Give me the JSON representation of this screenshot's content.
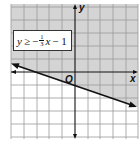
{
  "figure": {
    "type": "linear-inequality-graph",
    "inequality": {
      "lhs": "y",
      "relation": "≥",
      "sign": "−",
      "slope_numerator": "1",
      "slope_denominator": "3",
      "variable": "x",
      "constant_term": "− 1"
    },
    "axes": {
      "x_label": "x",
      "y_label": "y",
      "origin_label": "O"
    },
    "line": {
      "slope": -0.3333,
      "y_intercept": -1,
      "style": "solid"
    },
    "shaded_region": "above",
    "grid": {
      "x_range": [
        -5,
        5
      ],
      "y_range": [
        -5,
        5
      ],
      "step": 1
    },
    "colors": {
      "shade": "#d4d4d4",
      "grid": "#9a9a9a",
      "line": "#111111",
      "background": "#ffffff"
    }
  }
}
